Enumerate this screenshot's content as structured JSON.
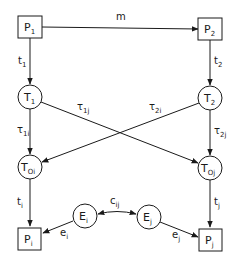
{
  "diagram": {
    "colors": {
      "stroke": "#1a1a1a",
      "background": "#ffffff"
    },
    "nodes": {
      "P1": {
        "main": "P",
        "sub": "1",
        "shape": "square"
      },
      "P2": {
        "main": "P",
        "sub": "2",
        "shape": "square"
      },
      "T1": {
        "main": "T",
        "sub": "1",
        "shape": "circle"
      },
      "T2": {
        "main": "T",
        "sub": "2",
        "shape": "circle"
      },
      "Toi": {
        "main": "T",
        "sub": "Oi",
        "shape": "circle"
      },
      "Toj": {
        "main": "T",
        "sub": "Oj",
        "shape": "circle"
      },
      "Ei": {
        "main": "E",
        "sub": "i",
        "shape": "circle"
      },
      "Ej": {
        "main": "E",
        "sub": "j",
        "shape": "circle"
      },
      "Pi": {
        "main": "P",
        "sub": "i",
        "shape": "square"
      },
      "Pj": {
        "main": "P",
        "sub": "j",
        "shape": "square"
      }
    },
    "edges": {
      "m": {
        "from": "P1",
        "to": "P2",
        "main": "m",
        "sub": ""
      },
      "t1": {
        "from": "P1",
        "to": "T1",
        "main": "t",
        "sub": "1"
      },
      "t2": {
        "from": "P2",
        "to": "T2",
        "main": "t",
        "sub": "2"
      },
      "tau1i": {
        "from": "T1",
        "to": "Toi",
        "main": "τ",
        "sub": "1i"
      },
      "tau1j": {
        "from": "T1",
        "to": "Toj",
        "main": "τ",
        "sub": "1j"
      },
      "tau2i": {
        "from": "T2",
        "to": "Toi",
        "main": "τ",
        "sub": "2i"
      },
      "tau2j": {
        "from": "T2",
        "to": "Toj",
        "main": "τ",
        "sub": "2j"
      },
      "ti": {
        "from": "Toi",
        "to": "Pi",
        "main": "t",
        "sub": "i"
      },
      "tj": {
        "from": "Toj",
        "to": "Pj",
        "main": "t",
        "sub": "j"
      },
      "ei": {
        "from": "Ei",
        "to": "Pi",
        "main": "e",
        "sub": "i"
      },
      "ej": {
        "from": "Ej",
        "to": "Pj",
        "main": "e",
        "sub": "j"
      },
      "cij": {
        "from": "Ei",
        "to": "Ej",
        "main": "c",
        "sub": "ij",
        "bidirectional": true
      }
    }
  }
}
